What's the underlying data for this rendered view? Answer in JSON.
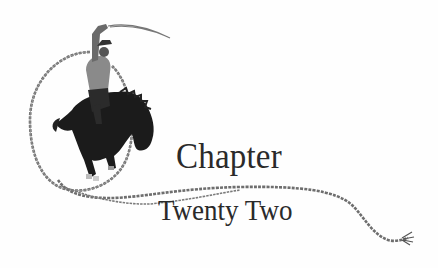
{
  "heading": {
    "line1": "Chapter",
    "line2": "Twenty Two"
  },
  "illustration": {
    "subject": "cowboy-on-bucking-horse-with-lasso",
    "rope_color": "#6f6f6f",
    "horse_color": "#1a1a1a",
    "text_color": "#2a2a2a",
    "background": "#fefefe"
  }
}
